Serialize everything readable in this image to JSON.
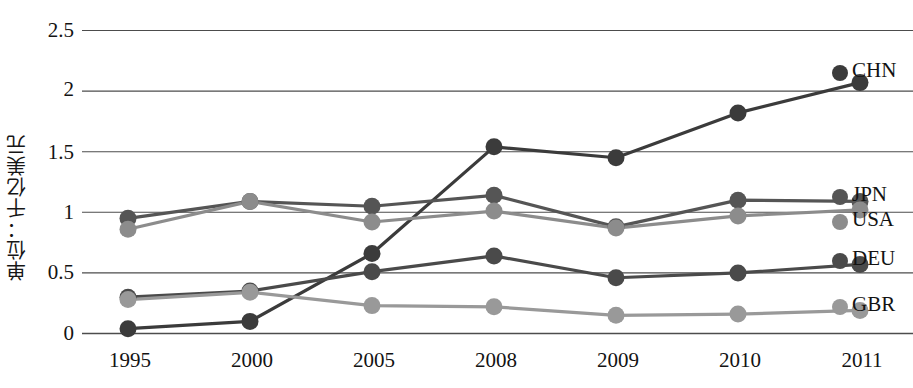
{
  "chart_data": {
    "type": "line",
    "title": "",
    "subtitle": "",
    "xlabel": "",
    "ylabel": "单位：千亿美元",
    "categories": [
      "1995",
      "2000",
      "2005",
      "2008",
      "2009",
      "2010",
      "2011"
    ],
    "ylim": [
      0,
      2.5
    ],
    "yticks": [
      "0",
      "0.5",
      "1",
      "1.5",
      "2",
      "2.5"
    ],
    "ytick_values": [
      0,
      0.5,
      1,
      1.5,
      2,
      2.5
    ],
    "grid": true,
    "legend_position": "right-of-plot",
    "series": [
      {
        "name": "CHN",
        "color": "#3b3b3b",
        "values": [
          0.04,
          0.1,
          0.66,
          1.54,
          1.45,
          1.82,
          2.07
        ]
      },
      {
        "name": "JPN",
        "color": "#555555",
        "values": [
          0.95,
          1.09,
          1.05,
          1.14,
          0.88,
          1.1,
          1.09
        ]
      },
      {
        "name": "USA",
        "color": "#8c8c8c",
        "values": [
          0.86,
          1.09,
          0.92,
          1.01,
          0.87,
          0.97,
          1.02
        ]
      },
      {
        "name": "DEU",
        "color": "#4a4a4a",
        "values": [
          0.3,
          0.35,
          0.51,
          0.64,
          0.46,
          0.5,
          0.57
        ]
      },
      {
        "name": "GBR",
        "color": "#999999",
        "values": [
          0.28,
          0.34,
          0.23,
          0.22,
          0.15,
          0.16,
          0.19
        ]
      }
    ]
  },
  "axis": {
    "ytick_labels": [
      "2.5",
      "2",
      "1.5",
      "1",
      "0.5",
      "0"
    ],
    "xtick_labels": [
      "1995",
      "2000",
      "2005",
      "2008",
      "2009",
      "2010",
      "2011"
    ],
    "ylabel_text": "单位：千亿美元"
  },
  "legend": {
    "entries": [
      {
        "label": "CHN",
        "color": "#3b3b3b"
      },
      {
        "label": "JPN",
        "color": "#555555"
      },
      {
        "label": "USA",
        "color": "#8c8c8c"
      },
      {
        "label": "DEU",
        "color": "#4a4a4a"
      },
      {
        "label": "GBR",
        "color": "#999999"
      }
    ]
  },
  "colors": {
    "gridline": "#4c4c4c",
    "background": "#ffffff",
    "text": "#131313"
  }
}
